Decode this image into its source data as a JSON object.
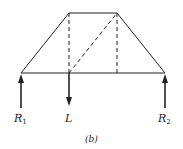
{
  "diagram": {
    "type": "truss",
    "caption": "(b)",
    "labels": {
      "r1": "R",
      "r1_sub": "1",
      "load": "L",
      "r2": "R",
      "r2_sub": "2"
    },
    "nodes": {
      "bottom_left": [
        21,
        73
      ],
      "bottom_mid": [
        69,
        73
      ],
      "bottom_right_inner": [
        117,
        73
      ],
      "bottom_right": [
        165,
        73
      ],
      "top_left": [
        69,
        13
      ],
      "top_right": [
        117,
        13
      ]
    },
    "members_solid": [
      "bottom_left-top_left",
      "top_left-top_right",
      "top_right-bottom_right",
      "bottom_left-bottom_right"
    ],
    "members_dashed": [
      "top_left-bottom_mid",
      "top_right-bottom_right_inner",
      "bottom_mid-top_right"
    ],
    "forces": [
      {
        "name": "R1",
        "direction": "up",
        "at": "bottom_left"
      },
      {
        "name": "L",
        "direction": "down",
        "at": "bottom_mid"
      },
      {
        "name": "R2",
        "direction": "up",
        "at": "bottom_right"
      }
    ],
    "colors": {
      "line": "#222222",
      "background": "#ffffff"
    }
  }
}
